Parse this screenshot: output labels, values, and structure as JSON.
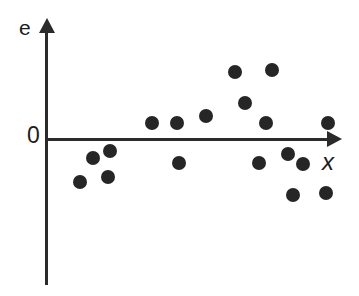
{
  "figure": {
    "type": "residual-scatter-plot",
    "background_color": "#ffffff",
    "ink_color": "#262626"
  },
  "labels": {
    "y_axis": "e",
    "x_axis": "x",
    "origin": "0"
  },
  "chart_data": {
    "type": "scatter",
    "title": "",
    "xlabel": "x",
    "ylabel": "e",
    "subtitle": "",
    "grid": false,
    "legend": null,
    "annotations": [
      "0"
    ],
    "axis_style": {
      "x_axis": "arrow-terminated horizontal line at e = 0",
      "y_axis": "arrow-terminated vertical line",
      "ticks": "none"
    },
    "xlim": [
      0,
      100
    ],
    "ylim": [
      -60,
      60
    ],
    "tick_labels": {
      "x": [],
      "y": [
        "0"
      ]
    },
    "series": [
      {
        "name": "residuals",
        "marker": "filled-circle",
        "color": "#262626",
        "points": [
          {
            "id": "p1",
            "x": 12.2,
            "y": -27.2,
            "px": 80,
            "py": 182
          },
          {
            "id": "p2",
            "x": 16.9,
            "y": -15.8,
            "px": 93,
            "py": 158
          },
          {
            "id": "p3",
            "x": 23.1,
            "y": -8.0,
            "px": 110,
            "py": 151
          },
          {
            "id": "p4",
            "x": 22.4,
            "y": -22.4,
            "px": 108,
            "py": 177
          },
          {
            "id": "p5",
            "x": 38.4,
            "y": 10.0,
            "px": 152,
            "py": 123
          },
          {
            "id": "p6",
            "x": 47.5,
            "y": 10.0,
            "px": 177,
            "py": 123
          },
          {
            "id": "p7",
            "x": 48.4,
            "y": -17.6,
            "px": 179,
            "py": 163
          },
          {
            "id": "p8",
            "x": 58.0,
            "y": 15.2,
            "px": 206,
            "py": 116
          },
          {
            "id": "p9",
            "x": 66.2,
            "y": 36.4,
            "px": 235,
            "py": 72
          },
          {
            "id": "p10",
            "x": 69.8,
            "y": 24.8,
            "px": 245,
            "py": 103
          },
          {
            "id": "p11",
            "x": 76.7,
            "y": 38.0,
            "px": 272,
            "py": 70
          },
          {
            "id": "p12",
            "x": 75.0,
            "y": 9.6,
            "px": 266,
            "py": 123
          },
          {
            "id": "p13",
            "x": 73.1,
            "y": -17.6,
            "px": 259,
            "py": 163
          },
          {
            "id": "p14",
            "x": 83.3,
            "y": -11.6,
            "px": 288,
            "py": 154
          },
          {
            "id": "p15",
            "x": 89.1,
            "y": -18.0,
            "px": 303,
            "py": 164
          },
          {
            "id": "p16",
            "x": 85.4,
            "y": -30.4,
            "px": 293,
            "py": 195
          },
          {
            "id": "p17",
            "x": 97.6,
            "y": 10.0,
            "px": 328,
            "py": 123
          },
          {
            "id": "p18",
            "x": 96.9,
            "y": -29.2,
            "px": 326,
            "py": 193
          }
        ]
      }
    ]
  }
}
